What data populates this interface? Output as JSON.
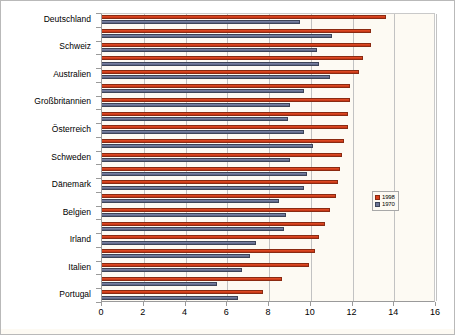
{
  "chart_data": {
    "type": "bar",
    "orientation": "horizontal",
    "title": "",
    "subtitle": "",
    "xlabel": "",
    "ylabel": "",
    "xlim": [
      0,
      16
    ],
    "xticks": [
      0,
      2,
      4,
      6,
      8,
      10,
      12,
      14,
      16
    ],
    "grid": "vertical",
    "legend_position": "right",
    "categories": [
      "Deutschland",
      "",
      "Schweiz",
      "",
      "Australien",
      "",
      "Großbritannien",
      "",
      "Österreich",
      "",
      "Schweden",
      "",
      "Dänemark",
      "",
      "Belgien",
      "",
      "Irland",
      "",
      "Italien",
      "",
      "Portugal"
    ],
    "labeled_categories": [
      "Deutschland",
      "Schweiz",
      "Australien",
      "Großbritannien",
      "Österreich",
      "Schweden",
      "Dänemark",
      "Belgien",
      "Irland",
      "Italien",
      "Portugal"
    ],
    "series": [
      {
        "name": "1998",
        "color": "#d9401c",
        "values": [
          13.6,
          12.9,
          12.9,
          12.5,
          12.3,
          11.9,
          11.9,
          11.8,
          11.8,
          11.6,
          11.5,
          11.4,
          11.3,
          11.2,
          10.9,
          10.7,
          10.4,
          10.2,
          9.9,
          8.6,
          7.7
        ]
      },
      {
        "name": "1970",
        "color": "#6c7596",
        "values": [
          9.5,
          11.0,
          10.3,
          10.4,
          10.9,
          9.7,
          9.0,
          8.9,
          9.7,
          10.1,
          9.0,
          9.8,
          9.7,
          8.5,
          8.8,
          8.7,
          7.4,
          7.1,
          6.7,
          5.5,
          6.5
        ]
      }
    ]
  },
  "legend": {
    "entries": [
      {
        "label": "1998"
      },
      {
        "label": "1970"
      }
    ]
  },
  "xaxis": {
    "tick_labels": [
      "0",
      "2",
      "4",
      "6",
      "8",
      "10",
      "12",
      "14",
      "16"
    ]
  }
}
